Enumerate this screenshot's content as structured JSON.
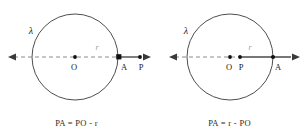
{
  "figure": {
    "type": "geometry-diagram",
    "panels": [
      {
        "id": "left",
        "circle_label": "λ",
        "center_label": "O",
        "radius_label": "r",
        "intersection_label": "A",
        "point_label": "P",
        "point_position": "outside",
        "caption": "PA = PO - r"
      },
      {
        "id": "right",
        "circle_label": "λ",
        "center_label": "O",
        "radius_label": "r",
        "intersection_label": "A",
        "point_label": "P",
        "point_position": "inside",
        "caption": "PA = r - PO"
      }
    ]
  },
  "colors": {
    "stroke": "#3a3a3a",
    "dashed": "#8c8c8c",
    "solid_segment": "#4a4a4a",
    "text": "#1a1a1a",
    "radius_text": "#9a9a9a",
    "background": "#ffffff"
  }
}
